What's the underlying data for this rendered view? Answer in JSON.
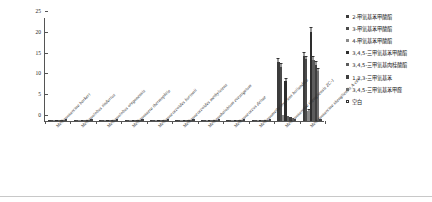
{
  "chart_data": {
    "type": "bar",
    "title": "",
    "subtitle": "",
    "xlabel": "",
    "ylabel": "甲氧基产物 (mmol/L)",
    "ylim": [
      0,
      25
    ],
    "yticks": [
      0,
      5,
      10,
      15,
      20,
      25
    ],
    "grid": false,
    "legend_position": "right",
    "categories": [
      "Methanosarcina barkeri",
      "Methanolobus tindarius",
      "Methanolobus oregonensis",
      "Methanosaeta thermophila",
      "Methanococcoides burtonii",
      "Methanococcoides methylutens",
      "Methanohalobium evestigatum",
      "Methanococcus deltae",
      "Methanomethylovorans hollandica",
      "Methanosarcina shengliensis ZC-1",
      "Methanosarcina shengliensis A-cell"
    ],
    "series": [
      {
        "name": "2-甲氧基苯甲酸酯",
        "color": "#3b3b3b",
        "values": [
          0.35,
          0.1,
          0.08,
          0.08,
          0.1,
          0.08,
          0.1,
          0.1,
          0.25,
          14.2,
          15.6
        ],
        "errors": [
          0.1,
          0.05,
          0.05,
          0.05,
          0.05,
          0.05,
          0.05,
          0.05,
          0.1,
          0.7,
          0.8
        ]
      },
      {
        "name": "3-甲氧基苯甲酸酯",
        "color": "#4a4a4a",
        "values": [
          0.2,
          0.08,
          0.06,
          0.06,
          0.08,
          0.06,
          0.08,
          0.08,
          0.2,
          13.1,
          14.8
        ],
        "errors": [
          0.08,
          0.04,
          0.04,
          0.04,
          0.04,
          0.04,
          0.04,
          0.04,
          0.08,
          0.6,
          0.7
        ]
      },
      {
        "name": "4-甲氧基苯甲酸酯",
        "color": "#8a8a8a",
        "values": [
          0.15,
          0.06,
          0.05,
          0.05,
          0.06,
          0.05,
          0.06,
          0.06,
          0.15,
          1.4,
          2.3
        ],
        "errors": [
          0.06,
          0.03,
          0.03,
          0.03,
          0.03,
          0.03,
          0.03,
          0.03,
          0.06,
          0.2,
          0.3
        ]
      },
      {
        "name": "3,4,5-三甲氧基苯甲酸酯",
        "color": "#2e2e2e",
        "values": [
          0.3,
          0.08,
          0.06,
          0.06,
          0.08,
          0.06,
          0.08,
          0.08,
          0.2,
          9.6,
          21.4
        ],
        "errors": [
          0.08,
          0.04,
          0.04,
          0.04,
          0.04,
          0.04,
          0.04,
          0.04,
          0.08,
          0.5,
          0.9
        ]
      },
      {
        "name": "3,4,5-三甲氧基肉桂酸酯",
        "color": "#5c5c5c",
        "values": [
          0.18,
          0.06,
          0.05,
          0.05,
          0.06,
          0.05,
          0.06,
          0.06,
          0.15,
          1.1,
          14.6
        ],
        "errors": [
          0.06,
          0.03,
          0.03,
          0.03,
          0.03,
          0.03,
          0.03,
          0.03,
          0.06,
          0.2,
          0.8
        ]
      },
      {
        "name": "1,2,3-三甲氧基苯",
        "color": "#3f3f3f",
        "values": [
          0.22,
          0.07,
          0.05,
          0.05,
          0.07,
          0.05,
          0.07,
          0.07,
          0.18,
          0.9,
          13.4
        ],
        "errors": [
          0.07,
          0.03,
          0.03,
          0.03,
          0.03,
          0.03,
          0.03,
          0.03,
          0.07,
          0.15,
          0.7
        ]
      },
      {
        "name": "3,4,5-三甲氧基苯甲醛",
        "color": "#6e6e6e",
        "values": [
          0.16,
          0.05,
          0.04,
          0.04,
          0.05,
          0.04,
          0.05,
          0.05,
          0.12,
          0.7,
          12.0
        ],
        "errors": [
          0.05,
          0.03,
          0.03,
          0.03,
          0.03,
          0.03,
          0.03,
          0.03,
          0.05,
          0.12,
          0.6
        ]
      },
      {
        "name": "空白",
        "color": "#ffffff",
        "values": [
          0.05,
          0.03,
          0.03,
          0.03,
          0.03,
          0.03,
          0.03,
          0.03,
          0.04,
          0.15,
          0.2
        ],
        "errors": [
          0.02,
          0.01,
          0.01,
          0.01,
          0.01,
          0.01,
          0.01,
          0.01,
          0.02,
          0.05,
          0.05
        ]
      }
    ]
  },
  "axis": {
    "y_label": "甲氧基产物 (mmol/L)",
    "y_tick_labels": [
      "0",
      "5",
      "10",
      "15",
      "20",
      "25"
    ]
  },
  "legend": {
    "items": [
      {
        "label": "2-甲氧基苯甲酸酯",
        "color": "#3b3b3b",
        "filled": true
      },
      {
        "label": "3-甲氧基苯甲酸酯",
        "color": "#4a4a4a",
        "filled": true
      },
      {
        "label": "4-甲氧基苯甲酸酯",
        "color": "#8a8a8a",
        "filled": true
      },
      {
        "label": "3,4,5-三甲氧基苯甲酸酯",
        "color": "#2e2e2e",
        "filled": true
      },
      {
        "label": "3,4,5-三甲氧基肉桂酸酯",
        "color": "#5c5c5c",
        "filled": true
      },
      {
        "label": "1,2,3-三甲氧基苯",
        "color": "#3f3f3f",
        "filled": true
      },
      {
        "label": "3,4,5-三甲氧基苯甲醛",
        "color": "#6e6e6e",
        "filled": true
      },
      {
        "label": "空白",
        "color": "#ffffff",
        "filled": false
      }
    ]
  },
  "colors": {
    "axis": "#555555",
    "text": "#1a1a1a",
    "background": "#ffffff",
    "rule": "#c8c8c8"
  }
}
